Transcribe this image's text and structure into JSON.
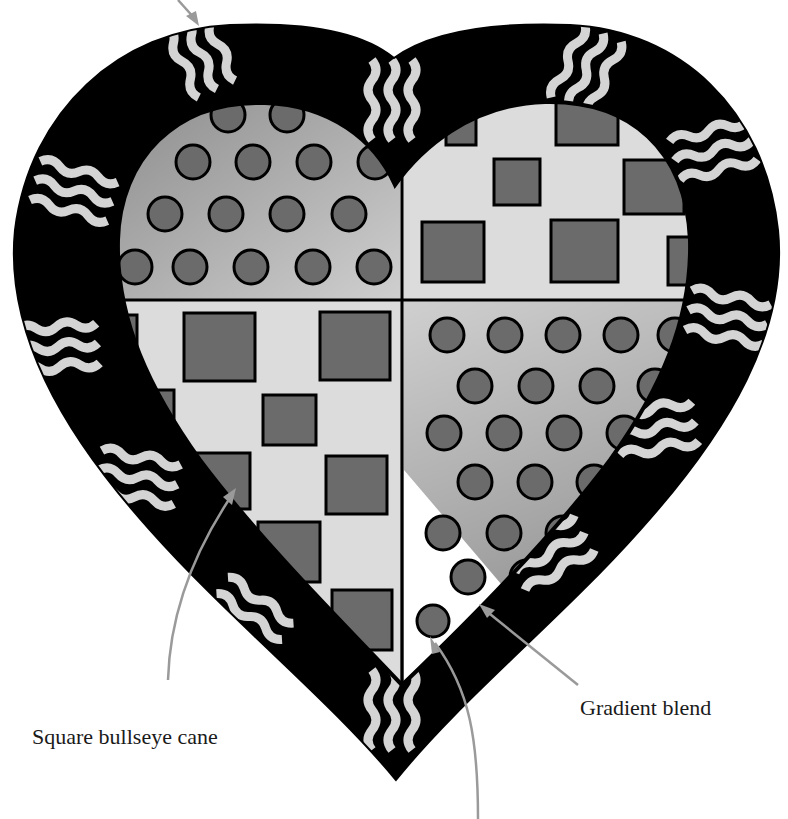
{
  "diagram": {
    "colors": {
      "border_black": "#000000",
      "wave_stripe": "#d4d4d4",
      "dot_fill": "#6b6b6b",
      "square_fill": "#6b6b6b",
      "light_background": "#dcdcdc",
      "gradient_dark": "#8a8a8a",
      "gradient_light": "#cfcfcf",
      "arrow": "#9a9a9a"
    },
    "quadrants": [
      {
        "position": "top-left",
        "pattern": "dots",
        "background": "gradient"
      },
      {
        "position": "top-right",
        "pattern": "squares",
        "background": "light"
      },
      {
        "position": "bottom-left",
        "pattern": "squares",
        "background": "light"
      },
      {
        "position": "bottom-right",
        "pattern": "dots",
        "background": "gradient"
      }
    ]
  },
  "labels": {
    "square_bullseye": "Square bullseye cane",
    "gradient_blend": "Gradient blend"
  }
}
